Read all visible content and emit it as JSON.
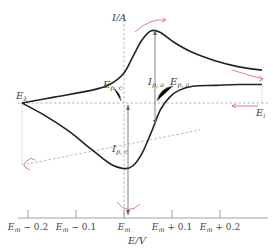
{
  "chart_data": {
    "type": "line",
    "xlabel": "E/V",
    "ylabel": "I/A",
    "x_ticks": [
      {
        "label_base": "E",
        "label_sub": "m",
        "label_suffix": " − 0.2",
        "value": -0.2
      },
      {
        "label_base": "E",
        "label_sub": "m",
        "label_suffix": " − 0.1",
        "value": -0.1
      },
      {
        "label_base": "E",
        "label_sub": "m",
        "label_suffix": "",
        "value": 0
      },
      {
        "label_base": "E",
        "label_sub": "m",
        "label_suffix": " + 0.1",
        "value": 0.1
      },
      {
        "label_base": "E",
        "label_sub": "m",
        "label_suffix": " + 0.2",
        "value": 0.2
      }
    ],
    "xlim": [
      -0.27,
      0.25
    ],
    "ylim": [
      -1.0,
      1.0
    ],
    "series": [
      {
        "name": "forward-scan (anodic)",
        "x": [
          -0.27,
          -0.2,
          -0.12,
          -0.08,
          -0.05,
          -0.03,
          -0.01,
          0.01,
          0.03,
          0.06,
          0.1,
          0.15,
          0.2,
          0.25
        ],
        "y": [
          0.0,
          0.07,
          0.15,
          0.22,
          0.35,
          0.55,
          0.75,
          0.86,
          0.84,
          0.72,
          0.6,
          0.5,
          0.43,
          0.39
        ]
      },
      {
        "name": "reverse-scan (cathodic)",
        "x": [
          0.25,
          0.2,
          0.15,
          0.1,
          0.07,
          0.05,
          0.03,
          0.01,
          -0.01,
          -0.03,
          -0.05,
          -0.08,
          -0.12,
          -0.17,
          -0.22,
          -0.27
        ],
        "y": [
          0.22,
          0.22,
          0.21,
          0.2,
          0.15,
          0.07,
          -0.08,
          -0.35,
          -0.6,
          -0.75,
          -0.78,
          -0.72,
          -0.55,
          -0.33,
          -0.15,
          0.0
        ]
      }
    ],
    "annotations": {
      "E_lambda": {
        "base": "E",
        "sub": "λ"
      },
      "E_i": {
        "base": "E",
        "sub": "i"
      },
      "E_pc": {
        "base": "E",
        "sub": "p, c"
      },
      "E_pa": {
        "base": "E",
        "sub": "p, a"
      },
      "I_pa": {
        "base": "I",
        "sub": "p, a"
      },
      "I_pc": {
        "base": "I",
        "sub": "p, c"
      }
    }
  }
}
